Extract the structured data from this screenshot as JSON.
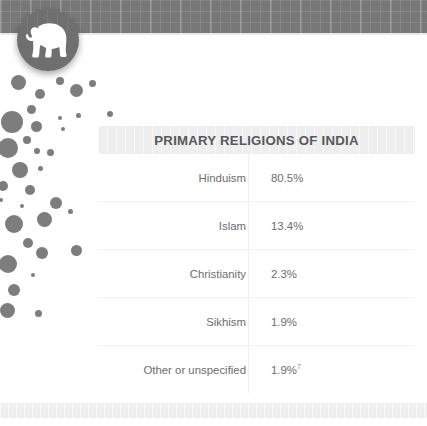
{
  "page": {
    "background_color": "#ffffff"
  },
  "header": {
    "banner_color": "#787878",
    "logo": {
      "icon": "elephant-icon",
      "badge_color": "#6f6f6f",
      "glyph_color": "#ffffff"
    }
  },
  "decoration": {
    "dots_color": "#7d7d7d",
    "dots": [
      {
        "x": 18,
        "y": 4,
        "r": 7.5
      },
      {
        "x": 40,
        "y": 16,
        "r": 5
      },
      {
        "x": 60,
        "y": 3,
        "r": 4
      },
      {
        "x": 76,
        "y": 12,
        "r": 6.5
      },
      {
        "x": 92,
        "y": 5,
        "r": 3.5
      },
      {
        "x": 31,
        "y": 31,
        "r": 4.5
      },
      {
        "x": 12,
        "y": 44,
        "r": 11
      },
      {
        "x": 36,
        "y": 48,
        "r": 5.5
      },
      {
        "x": 60,
        "y": 40,
        "r": 2
      },
      {
        "x": 78,
        "y": 37,
        "r": 2.5
      },
      {
        "x": 110,
        "y": 36,
        "r": 3
      },
      {
        "x": 27,
        "y": 62,
        "r": 4
      },
      {
        "x": 8,
        "y": 70,
        "r": 10
      },
      {
        "x": 37,
        "y": 73,
        "r": 3
      },
      {
        "x": 50,
        "y": 74,
        "r": 3.5
      },
      {
        "x": 63,
        "y": 51,
        "r": 2
      },
      {
        "x": 20,
        "y": 92,
        "r": 8
      },
      {
        "x": 40,
        "y": 90,
        "r": 2.5
      },
      {
        "x": 3,
        "y": 108,
        "r": 5
      },
      {
        "x": 30,
        "y": 112,
        "r": 5
      },
      {
        "x": 1,
        "y": 122,
        "r": 2
      },
      {
        "x": 22,
        "y": 128,
        "r": 2
      },
      {
        "x": 56,
        "y": 125,
        "r": 6
      },
      {
        "x": 44,
        "y": 141,
        "r": 7.5
      },
      {
        "x": 14,
        "y": 146,
        "r": 9
      },
      {
        "x": 70,
        "y": 133,
        "r": 2.5
      },
      {
        "x": 28,
        "y": 165,
        "r": 5
      },
      {
        "x": 42,
        "y": 175,
        "r": 6
      },
      {
        "x": 76,
        "y": 172,
        "r": 5.5
      },
      {
        "x": 8,
        "y": 186,
        "r": 9
      },
      {
        "x": 33,
        "y": 197,
        "r": 2
      },
      {
        "x": 14,
        "y": 212,
        "r": 6
      },
      {
        "x": 7,
        "y": 232,
        "r": 7.5
      },
      {
        "x": 38,
        "y": 235,
        "r": 3.5
      }
    ]
  },
  "table": {
    "title": "PRIMARY RELIGIONS OF INDIA",
    "title_bar_color": "#eeeeee",
    "rows": [
      {
        "label": "Hinduism",
        "value": "80.5%",
        "footnote": ""
      },
      {
        "label": "Islam",
        "value": "13.4%",
        "footnote": ""
      },
      {
        "label": "Christianity",
        "value": "2.3%",
        "footnote": ""
      },
      {
        "label": "Sikhism",
        "value": "1.9%",
        "footnote": ""
      },
      {
        "label": "Other or unspecified",
        "value": "1.9%",
        "footnote": "7"
      }
    ]
  },
  "footer": {
    "band_color": "#efefef"
  }
}
